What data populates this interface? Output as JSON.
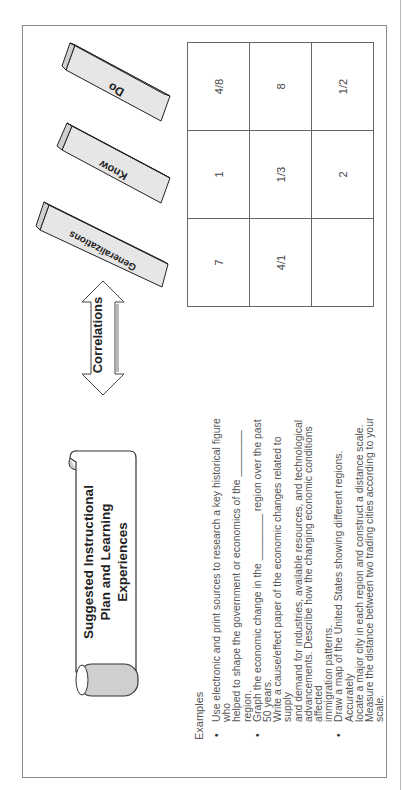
{
  "header": {
    "title_line1": "Suggested Instructional",
    "title_line2": "Plan and Learning Experiences"
  },
  "arrow": {
    "label": "Correlations"
  },
  "blocks": [
    {
      "label": "Generalizations"
    },
    {
      "label": "Know"
    },
    {
      "label": "Do"
    }
  ],
  "grid": {
    "rows": [
      [
        "7",
        "1",
        "4/8"
      ],
      [
        "4/1",
        "1/3",
        "8"
      ],
      [
        "",
        "2",
        "1/2"
      ]
    ]
  },
  "examples": {
    "label": "Examples",
    "bullets": [
      {
        "lines": [
          "Use electronic and print sources to research a key historical figure who",
          "helped to shape the government or economics of the ________ region."
        ]
      },
      {
        "lines": [
          "Graph the economic change in the ________ region over the past 50 years.",
          "Write a cause/effect paper of the economic changes related to supply",
          "and demand for industries, available resources, and technological",
          "advancements.  Describe how the changing economic conditions affected",
          "immigration patterns."
        ]
      },
      {
        "lines": [
          "Draw a map of the United States showing different regions. Accurately",
          "locate a major city in each region and construct a distance scale.",
          "Measure the distance between two trading cities according to your scale."
        ]
      }
    ]
  }
}
